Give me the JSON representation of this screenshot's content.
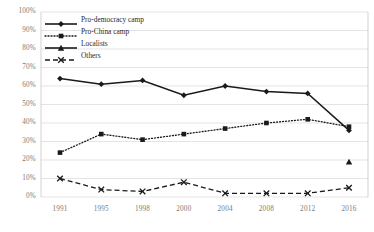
{
  "chart_data": {
    "type": "line",
    "title": "",
    "xlabel": "",
    "ylabel": "",
    "categories": [
      "1991",
      "1995",
      "1998",
      "2000",
      "2004",
      "2008",
      "2012",
      "2016"
    ],
    "ylim": [
      0,
      100
    ],
    "ytick_labels": [
      "0%",
      "10%",
      "20%",
      "30%",
      "40%",
      "50%",
      "60%",
      "70%",
      "80%",
      "90%",
      "100%"
    ],
    "ytick_values": [
      0,
      10,
      20,
      30,
      40,
      50,
      60,
      70,
      80,
      90,
      100
    ],
    "grid": true,
    "legend_position": "top-left",
    "series": [
      {
        "name": "Pro-democracy camp",
        "marker": "diamond",
        "line_style": "solid",
        "color": "#1a1a1a",
        "values": [
          64,
          61,
          63,
          55,
          60,
          57,
          56,
          36
        ]
      },
      {
        "name": "Pro-China camp",
        "marker": "square",
        "line_style": "dotted",
        "color": "#1a1a1a",
        "values": [
          24,
          34,
          31,
          34,
          37,
          40,
          42,
          38
        ]
      },
      {
        "name": "Localists",
        "marker": "triangle",
        "line_style": "solid",
        "color": "#1a1a1a",
        "values": [
          null,
          null,
          null,
          null,
          null,
          null,
          null,
          19
        ]
      },
      {
        "name": "Others",
        "marker": "cross",
        "line_style": "dashed",
        "color": "#1a1a1a",
        "values": [
          10,
          4,
          3,
          8,
          2,
          2,
          2,
          5
        ]
      }
    ]
  },
  "axis": {
    "gridline_color": "#d9d9d9",
    "tick_text_color": "#7a7a78",
    "border_color": "#bfbfbf"
  }
}
